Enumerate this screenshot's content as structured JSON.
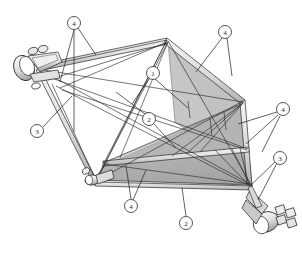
{
  "figure": {
    "background_color": "#ffffff",
    "line_color": "#222222",
    "callout_circle_fill": "#ffffff",
    "callout_circle_stroke": "#2a2a2a",
    "panel_fill_light": "#cfcfcf",
    "panel_fill_mid": "#b4b4b4",
    "panel_fill_dark": "#9a9a9a",
    "strut_fill": "#e8e8e8",
    "hub_fill": "#dcdcdc"
  },
  "callouts": [
    {
      "id": "callout-4-top-left",
      "label": "4",
      "cx": 74,
      "cy": 23
    },
    {
      "id": "callout-4-top-right",
      "label": "4",
      "cx": 225,
      "cy": 32
    },
    {
      "id": "callout-1-center",
      "label": "1",
      "cx": 153,
      "cy": 73
    },
    {
      "id": "callout-4-right",
      "label": "4",
      "cx": 283,
      "cy": 109
    },
    {
      "id": "callout-2-center",
      "label": "2",
      "cx": 149,
      "cy": 119
    },
    {
      "id": "callout-3-left",
      "label": "3",
      "cx": 37,
      "cy": 131
    },
    {
      "id": "callout-3-right",
      "label": "3",
      "cx": 280,
      "cy": 158
    },
    {
      "id": "callout-4-bottom",
      "label": "4",
      "cx": 131,
      "cy": 206
    },
    {
      "id": "callout-2-bottom",
      "label": "2",
      "cx": 186,
      "cy": 223
    }
  ],
  "components": {
    "hub_upper_left": "cylindrical end fitting, upper left",
    "hub_lower_right": "cylindrical end fitting, lower right",
    "joint_lower_left": "cylindrical node joint, lower left",
    "panel_upper": "shaded triangular membrane panel, upper right",
    "panel_lower": "shaded triangular membrane panel, lower",
    "longeron_main": "main boom longeron",
    "diagonal_cables": "tension diagonal members"
  }
}
